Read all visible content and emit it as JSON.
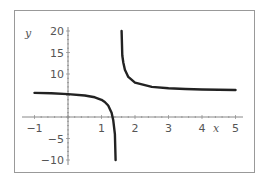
{
  "chart_data": {
    "type": "line",
    "title": "",
    "xlabel": "x",
    "ylabel": "y",
    "xlim": [
      -1.1,
      5.1
    ],
    "ylim": [
      -11,
      21
    ],
    "grid": false,
    "legend": "none",
    "x_ticks": [
      -1,
      1,
      2,
      3,
      4,
      5
    ],
    "x_tick_labels": [
      "−1",
      "1",
      "2",
      "3",
      "4",
      "5"
    ],
    "y_ticks": [
      20,
      15,
      10,
      -5,
      -10
    ],
    "y_tick_labels": [
      "20",
      "15",
      "10",
      "−5",
      "−10"
    ],
    "vertical_asymptote": 1.5,
    "horizontal_asymptote": 6,
    "series": [
      {
        "name": "left branch",
        "x": [
          -1.0,
          -0.5,
          0.0,
          0.5,
          0.8,
          1.0,
          1.1,
          1.2,
          1.3,
          1.35,
          1.4,
          1.42
        ],
        "y": [
          5.6,
          5.5,
          5.33,
          5.0,
          4.57,
          4.0,
          3.5,
          2.67,
          1.0,
          -0.67,
          -4.0,
          -10.0
        ]
      },
      {
        "name": "right branch",
        "x": [
          1.6,
          1.62,
          1.65,
          1.7,
          1.8,
          2.0,
          2.5,
          3.0,
          3.5,
          4.0,
          4.5,
          5.0
        ],
        "y": [
          20.0,
          14.3,
          12.67,
          11.0,
          9.33,
          8.0,
          7.0,
          6.67,
          6.5,
          6.4,
          6.33,
          6.29
        ]
      }
    ],
    "colors": {
      "curve": "#222222",
      "axes": "#888888",
      "frame": "#999999",
      "text": "#555555"
    }
  }
}
